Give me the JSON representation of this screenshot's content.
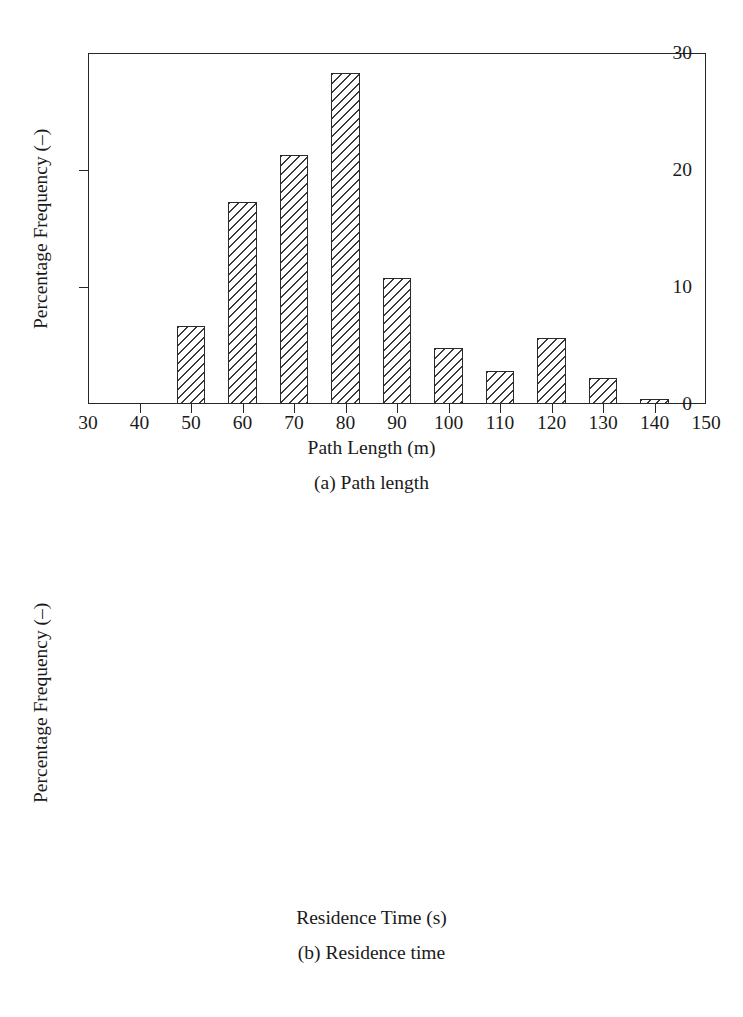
{
  "figure": {
    "panels": [
      {
        "id": "a",
        "caption": "(a) Path length",
        "chart": {
          "type": "bar",
          "title": "",
          "xlabel": "Path Length (m)",
          "ylabel": "Percentage Frequency (–)",
          "xlim": [
            30,
            150
          ],
          "ylim": [
            0,
            30
          ],
          "xticks": [
            30,
            40,
            50,
            60,
            70,
            80,
            90,
            100,
            110,
            120,
            130,
            140,
            150
          ],
          "yticks": [
            0,
            10,
            20,
            30
          ],
          "grid": false,
          "legend": null,
          "categories": [
            50,
            60,
            70,
            80,
            90,
            100,
            110,
            120,
            130,
            140
          ],
          "values": [
            6.7,
            17.3,
            21.3,
            28.3,
            10.8,
            4.8,
            2.8,
            5.6,
            2.2,
            0.4
          ],
          "bar_width_units": 5.5
        }
      },
      {
        "id": "b",
        "caption": "(b) Residence time",
        "chart": {
          "type": "bar",
          "title": "",
          "xlabel": "Residence Time (s)",
          "ylabel": "Percentage Frequency (–)",
          "xlim": [
            3,
            42
          ],
          "ylim": [
            0,
            40
          ],
          "xticks": [
            3,
            6,
            9,
            12,
            15,
            18,
            21,
            24,
            27,
            30,
            33,
            36,
            39,
            42
          ],
          "yticks": [
            0,
            10,
            20,
            30,
            40
          ],
          "grid": false,
          "legend": null,
          "categories": [
            6,
            9,
            12,
            15,
            18,
            21,
            24,
            27,
            30,
            33,
            36,
            39
          ],
          "values": [
            8.4,
            24.0,
            34.0,
            18.6,
            6.1,
            5.0,
            2.2,
            0.8,
            0.5,
            0.2,
            0.12,
            0.1
          ],
          "bar_width_units": 1.5
        }
      }
    ]
  },
  "chart_data": [
    {
      "type": "bar",
      "title": "(a) Path length",
      "xlabel": "Path Length (m)",
      "ylabel": "Percentage Frequency (–)",
      "categories": [
        50,
        60,
        70,
        80,
        90,
        100,
        110,
        120,
        130,
        140
      ],
      "values": [
        6.7,
        17.3,
        21.3,
        28.3,
        10.8,
        4.8,
        2.8,
        5.6,
        2.2,
        0.4
      ],
      "xlim": [
        30,
        150
      ],
      "ylim": [
        0,
        30
      ],
      "xticks": [
        30,
        40,
        50,
        60,
        70,
        80,
        90,
        100,
        110,
        120,
        130,
        140,
        150
      ],
      "yticks": [
        0,
        10,
        20,
        30
      ],
      "grid": false,
      "legend": null
    },
    {
      "type": "bar",
      "title": "(b) Residence time",
      "xlabel": "Residence Time (s)",
      "ylabel": "Percentage Frequency (–)",
      "categories": [
        6,
        9,
        12,
        15,
        18,
        21,
        24,
        27,
        30,
        33,
        36,
        39
      ],
      "values": [
        8.4,
        24.0,
        34.0,
        18.6,
        6.1,
        5.0,
        2.2,
        0.8,
        0.5,
        0.2,
        0.12,
        0.1
      ],
      "xlim": [
        3,
        42
      ],
      "ylim": [
        0,
        40
      ],
      "xticks": [
        3,
        6,
        9,
        12,
        15,
        18,
        21,
        24,
        27,
        30,
        33,
        36,
        39,
        42
      ],
      "yticks": [
        0,
        10,
        20,
        30,
        40
      ],
      "grid": false,
      "legend": null
    }
  ]
}
